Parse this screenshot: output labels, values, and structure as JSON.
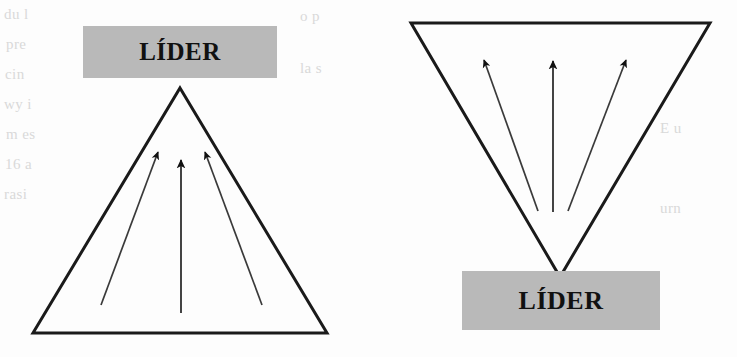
{
  "figure": {
    "title": "",
    "background_color": "#fdfdfd",
    "label_box_color": "#b9b9b9",
    "stroke_color": "#1a1a1a"
  },
  "diagrams": [
    {
      "id": "upward-triangle",
      "name": "leader-at-apex",
      "shape": "triangle-up",
      "label": "LÍDER",
      "label_position": "top",
      "arrow_count": 3,
      "arrow_direction": "converging-upward"
    },
    {
      "id": "inverted-triangle",
      "name": "leader-at-base",
      "shape": "triangle-down",
      "label": "LÍDER",
      "label_position": "bottom",
      "arrow_count": 3,
      "arrow_direction": "diverging-upward"
    }
  ],
  "labels": {
    "left": "LÍDER",
    "right": "LÍDER"
  },
  "background_text": [
    "du l",
    "pre",
    "cin",
    "wy i",
    "m es",
    "16 a",
    "rasi",
    "o p",
    "la s",
    "E u",
    "urn"
  ]
}
